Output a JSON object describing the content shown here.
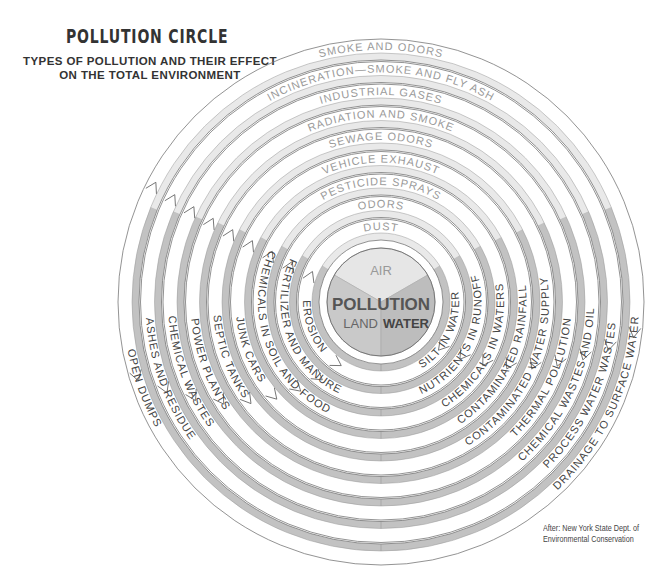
{
  "header": {
    "title": "POLLUTION CIRCLE",
    "subtitle_line1": "TYPES OF POLLUTION AND THEIR EFFECT",
    "subtitle_line2": "ON THE TOTAL ENVIRONMENT"
  },
  "center": {
    "title": "POLLUTION",
    "sectors": [
      {
        "label": "AIR",
        "color": "#e6e6e6"
      },
      {
        "label": "LAND",
        "color": "#c9c9c9"
      },
      {
        "label": "WATER",
        "color": "#bdbdbd"
      }
    ]
  },
  "colors": {
    "air_band": "#e9e9e9",
    "land_water_band": "#c2c2c2",
    "outline": "#777777",
    "text_air": "#9a9a9a",
    "text_dark": "#444444"
  },
  "rings": [
    {
      "air": "DUST",
      "land": "EROSION",
      "water": "SILT IN WATER"
    },
    {
      "air": "ODORS",
      "land": "FERTILIZER AND MANURE",
      "water": "NUTRIENTS IN RUNOFF"
    },
    {
      "air": "PESTICIDE SPRAYS",
      "land": "CHEMICALS IN SOIL AND FOOD",
      "water": "CHEMICALS IN WATERS"
    },
    {
      "air": "VEHICLE EXHAUST",
      "land": "JUNK CARS",
      "water": "CONTAMINATED RAINFALL"
    },
    {
      "air": "SEWAGE ODORS",
      "land": "SEPTIC TANKS",
      "water": "CONTAMINATED WATER SUPPLY"
    },
    {
      "air": "RADIATION AND SMOKE",
      "land": "POWER PLANTS",
      "water": "THERMAL POLLUTION"
    },
    {
      "air": "INDUSTRIAL GASES",
      "land": "CHEMICAL WASTES",
      "water": "CHEMICAL WASTES AND OIL"
    },
    {
      "air": "INCINERATION—SMOKE AND FLY ASH",
      "land": "ASHES AND RESIDUE",
      "water": "PROCESS WATER WASTES"
    },
    {
      "air": "SMOKE AND ODORS",
      "land": "OPEN DUMPS",
      "water": "DRAINAGE TO SURFACE WATER"
    }
  ],
  "footer": {
    "credit_line1": "After: New York State Dept. of",
    "credit_line2": "Environmental Conservation"
  }
}
